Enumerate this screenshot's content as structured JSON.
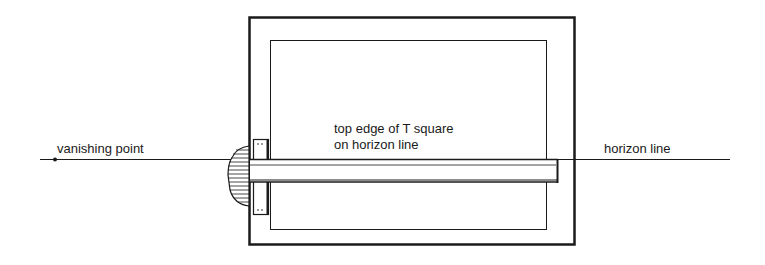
{
  "labels": {
    "vanishing_point": "vanishing point",
    "t_square_line1": "top edge of T square",
    "t_square_line2": "on horizon line",
    "horizon_line": "horizon line"
  },
  "colors": {
    "ink": "#1a1a1a",
    "background": "#ffffff"
  }
}
